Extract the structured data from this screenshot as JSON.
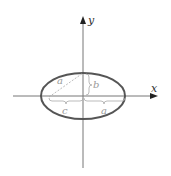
{
  "diagram": {
    "type": "ellipse-geometry",
    "axes": {
      "x_label": "x",
      "y_label": "y"
    },
    "labels": {
      "hypotenuse": "a",
      "semi_minor": "b",
      "focal_distance": "c",
      "semi_major": "a"
    },
    "colors": {
      "ellipse": "#555555",
      "axes": "#666666",
      "annotation": "#aaaaaa",
      "background": "#ffffff"
    }
  }
}
